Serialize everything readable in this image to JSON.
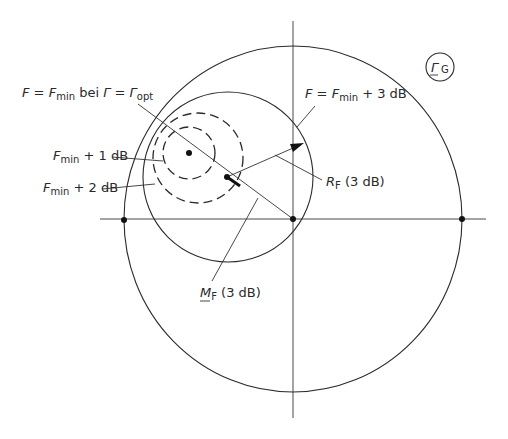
{
  "diagram": {
    "title_symbol": "Γ",
    "title_symbol_sub": "G",
    "labels": {
      "optimum": {
        "F": "F",
        "eq": " = ",
        "Fmin": "F",
        "min": "min",
        "bei": " bei ",
        "gamma": "Γ",
        "eq2": " = ",
        "gamma2": "Γ",
        "opt": "opt"
      },
      "plus1": {
        "F": "F",
        "min": "min",
        "rest": " + 1 dB"
      },
      "plus2": {
        "F": "F",
        "min": "min",
        "rest": " + 2 dB"
      },
      "plus3": {
        "F": "F",
        "eq": " = ",
        "F2": "F",
        "min": "min",
        "rest": " + 3 dB"
      },
      "radius": {
        "R": "R",
        "sub": "F",
        "rest": " (3 dB)"
      },
      "center": {
        "M": "M",
        "sub": "F",
        "rest": " (3 dB)"
      }
    },
    "elements": {
      "unit_circle": {
        "cx": 293,
        "cy": 219,
        "rx": 169,
        "ry": 173
      },
      "noise_circle_3dB": {
        "cx": 228,
        "cy": 177,
        "r": 85
      },
      "noise_circle_1dB": {
        "cx": 189,
        "cy": 153,
        "r": 26,
        "style": "dashed"
      },
      "noise_circle_2dB": {
        "cx": 198,
        "cy": 158,
        "r": 45,
        "style": "dashed"
      },
      "gamma_opt_point": {
        "x": 189,
        "y": 153
      },
      "center_point_MF": {
        "x": 227,
        "y": 177
      },
      "origin": {
        "x": 293,
        "y": 219
      }
    }
  }
}
